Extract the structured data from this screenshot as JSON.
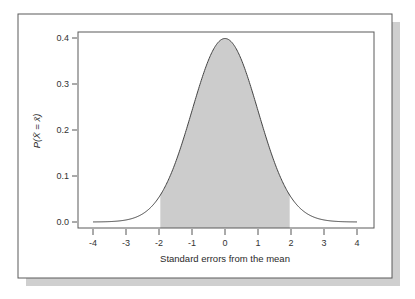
{
  "chart_data": {
    "type": "area",
    "title": "",
    "xlabel": "Standard errors from the mean",
    "ylabel": "P(X̄ = x̄)",
    "xlim": [
      -4,
      4
    ],
    "ylim": [
      0.0,
      0.4
    ],
    "x_ticks": [
      -4,
      -3,
      -2,
      -1,
      0,
      1,
      2,
      3,
      4
    ],
    "x_tick_labels": [
      "-4",
      "-3",
      "-2",
      "-1",
      "0",
      "1",
      "2",
      "3",
      "4"
    ],
    "y_ticks": [
      0.0,
      0.1,
      0.2,
      0.3,
      0.4
    ],
    "y_tick_labels": [
      "0.0",
      "0.1",
      "0.2",
      "0.3",
      "0.4"
    ],
    "grid": false,
    "legend": null,
    "series": [
      {
        "name": "Normal density (mean 0, sd 1)",
        "x": [
          -4,
          -3.5,
          -3,
          -2.5,
          -2,
          -1.5,
          -1,
          -0.5,
          0,
          0.5,
          1,
          1.5,
          2,
          2.5,
          3,
          3.5,
          4
        ],
        "values": [
          0.0001,
          0.0009,
          0.0044,
          0.0175,
          0.054,
          0.1295,
          0.242,
          0.3521,
          0.3989,
          0.3521,
          0.242,
          0.1295,
          0.054,
          0.0175,
          0.0044,
          0.0009,
          0.0001
        ]
      }
    ],
    "shaded_region": {
      "from": -1.96,
      "to": 1.96,
      "color": "#cccccc"
    },
    "colors": {
      "curve": "#444444",
      "shade": "#cccccc",
      "frame": "#555555",
      "shadow": "#c8c8c8"
    }
  }
}
